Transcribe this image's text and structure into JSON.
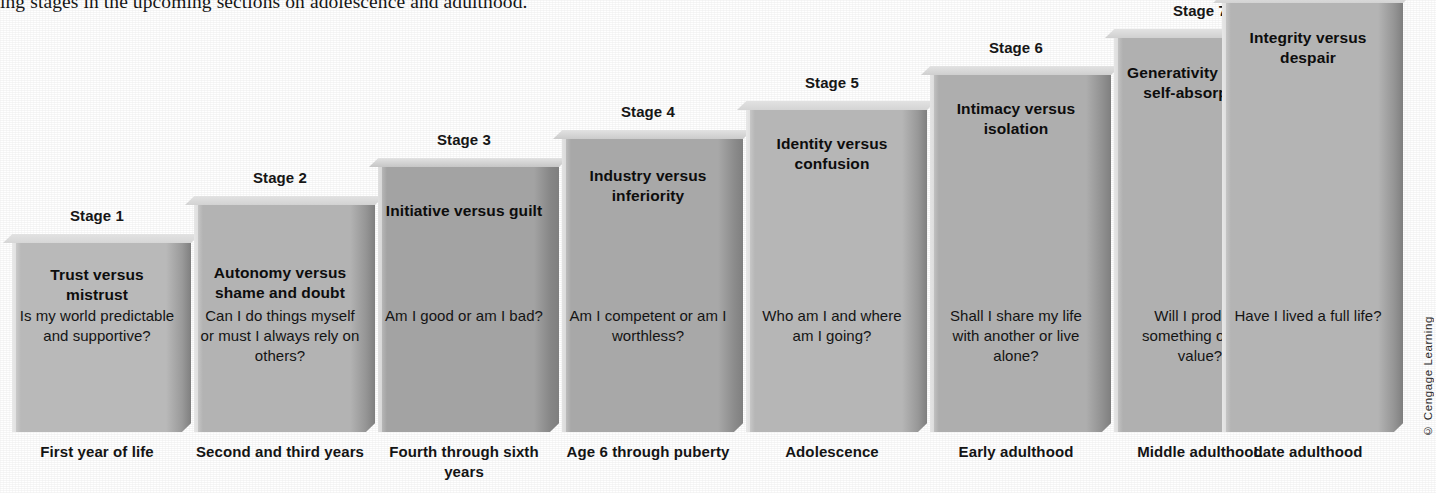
{
  "page": {
    "running_text": "ing stages in the upcoming sections on adolescence and adulthood.",
    "copyright": "© Cengage Learning"
  },
  "diagram": {
    "type": "stairstep-block-diagram",
    "baseline_y": 432,
    "stages": [
      {
        "stage_label": "Stage 1",
        "crisis": "Trust versus mistrust",
        "question": "Is my world predictable and supportive?",
        "age_label": "First year of life",
        "x": 12,
        "width": 170,
        "top": 243,
        "fill": "#b9b9b9",
        "top_fill": "#d6d6d6",
        "side_fill": "#9a9a9a",
        "crisis_top": 22,
        "question_top": 63
      },
      {
        "stage_label": "Stage 2",
        "crisis": "Autonomy versus shame and doubt",
        "question": "Can I do things myself or must I always rely on others?",
        "age_label": "Second and third years",
        "x": 194,
        "width": 172,
        "top": 205,
        "fill": "#b3b3b3",
        "top_fill": "#d2d2d2",
        "side_fill": "#959595",
        "crisis_top": 58,
        "question_top": 101
      },
      {
        "stage_label": "Stage 3",
        "crisis": "Initiative versus guilt",
        "question": "Am I good or am I bad?",
        "age_label": "Fourth through sixth years",
        "x": 378,
        "width": 172,
        "top": 167,
        "fill": "#a3a3a3",
        "top_fill": "#c6c6c6",
        "side_fill": "#878787",
        "crisis_top": 34,
        "question_top": 139
      },
      {
        "stage_label": "Stage 4",
        "crisis": "Industry versus inferiority",
        "question": "Am I competent or am I worthless?",
        "age_label": "Age 6 through puberty",
        "x": 562,
        "width": 172,
        "top": 139,
        "fill": "#a8a8a8",
        "top_fill": "#cbcbcb",
        "side_fill": "#8c8c8c",
        "crisis_top": 27,
        "question_top": 167
      },
      {
        "stage_label": "Stage 5",
        "crisis": "Identity versus confusion",
        "question": "Who am I and where am I going?",
        "age_label": "Adolescence",
        "x": 746,
        "width": 172,
        "top": 110,
        "fill": "#b6b6b6",
        "top_fill": "#d4d4d4",
        "side_fill": "#989898",
        "crisis_top": 24,
        "question_top": 196
      },
      {
        "stage_label": "Stage 6",
        "crisis": "Intimacy versus isolation",
        "question": "Shall I share my life with another or live alone?",
        "age_label": "Early adulthood",
        "x": 930,
        "width": 172,
        "top": 75,
        "fill": "#aeaeae",
        "top_fill": "#cfcfcf",
        "side_fill": "#919191",
        "crisis_top": 24,
        "question_top": 231
      },
      {
        "stage_label": "Stage 7",
        "crisis": "Generativity versus self-absorption",
        "question": "Will I produce something of real value?",
        "age_label": "Middle adulthood",
        "x": 1114,
        "width": 172,
        "top": 38,
        "fill": "#b0b0b0",
        "top_fill": "#d0d0d0",
        "side_fill": "#939393",
        "crisis_top": 25,
        "question_top": 268
      },
      {
        "stage_label": "",
        "crisis": "Integrity versus despair",
        "question": "Have I lived a full life?",
        "age_label": "Late adulthood",
        "x": 1222,
        "width": 172,
        "top": 3,
        "fill": "#b4b4b4",
        "top_fill": "#d3d3d3",
        "side_fill": "#959595",
        "crisis_top": 25,
        "question_top": 303
      }
    ]
  }
}
